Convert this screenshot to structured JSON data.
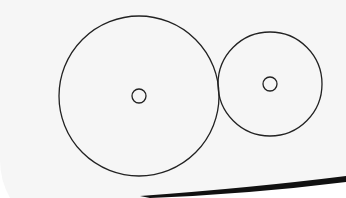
{
  "diagram": {
    "background": "#f7f7f7",
    "stroke_color": "#222222",
    "circles": [
      {
        "name": "large-circle",
        "cx": 139,
        "cy": 96,
        "r": 80,
        "center_marker_r": 7
      },
      {
        "name": "small-circle",
        "cx": 270,
        "cy": 84,
        "r": 52,
        "center_marker_r": 7
      }
    ]
  }
}
